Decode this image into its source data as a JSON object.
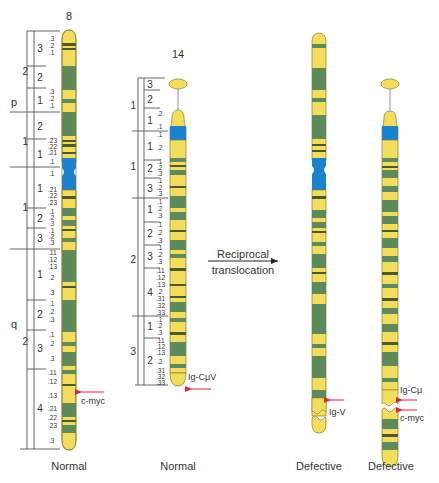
{
  "colors": {
    "light_band": "#f2de5c",
    "dark_band": "#5e8a5a",
    "thin_band": "#4a5a2a",
    "centromere": "#1a82cc",
    "outline": "#8a7a30",
    "arrow": "#d8283a",
    "text": "#333333"
  },
  "chromosomes": [
    {
      "id": "chr8-normal",
      "number": "8",
      "caption": "Normal",
      "arms": {
        "p": {
          "label": "p",
          "regions": [
            {
              "region": "2",
              "bands": [
                {
                  "band": "3",
                  "sub": [
                    ".3",
                    ".2",
                    ".1"
                  ]
                },
                {
                  "band": "2",
                  "sub": []
                },
                {
                  "band": "1",
                  "sub": [
                    ".3",
                    ".2",
                    ".1"
                  ]
                }
              ]
            },
            {
              "region": "1",
              "bands": [
                {
                  "band": "2",
                  "sub": []
                },
                {
                  "band": "1",
                  "sub": [
                    ".23",
                    ".22",
                    ".21",
                    ".1"
                  ]
                }
              ]
            }
          ]
        },
        "q": {
          "label": "q",
          "regions": [
            {
              "region": "1",
              "bands": [
                {
                  "band": "1",
                  "sub": [
                    ".1",
                    ".21",
                    ".22",
                    ".23"
                  ]
                },
                {
                  "band": "2",
                  "sub": [
                    ".1",
                    ".2",
                    ".3"
                  ]
                },
                {
                  "band": "3",
                  "sub": [
                    ".1",
                    ".2",
                    ".3"
                  ]
                }
              ]
            },
            {
              "region": "2",
              "bands": [
                {
                  "band": "1",
                  "sub": [
                    ".11",
                    ".12",
                    ".13",
                    ".2",
                    ".3"
                  ]
                },
                {
                  "band": "2",
                  "sub": [
                    ".1",
                    ".2",
                    ".3"
                  ]
                },
                {
                  "band": "3",
                  "sub": [
                    ".1",
                    ".2",
                    ".3"
                  ]
                },
                {
                  "band": "4",
                  "sub": [
                    ".11",
                    ".12",
                    ".13",
                    ".21",
                    ".22",
                    ".23",
                    ".3"
                  ]
                }
              ]
            }
          ]
        }
      },
      "gene_marks": [
        {
          "label": "c-myc"
        }
      ]
    },
    {
      "id": "chr14-normal",
      "number": "14",
      "caption": "Normal",
      "arms": {
        "p": {
          "regions": [
            {
              "region": "1",
              "bands": [
                {
                  "band": "3",
                  "sub": []
                },
                {
                  "band": "2",
                  "sub": []
                },
                {
                  "band": "1",
                  "sub": [
                    ".2",
                    ".1"
                  ]
                }
              ]
            }
          ]
        },
        "q": {
          "regions": [
            {
              "region": "1",
              "bands": [
                {
                  "band": "1",
                  "sub": [
                    ".1",
                    ".2"
                  ]
                },
                {
                  "band": "2",
                  "sub": [
                    ".1",
                    ".2",
                    ".3"
                  ]
                },
                {
                  "band": "3",
                  "sub": [
                    ".1",
                    ".2",
                    ".3"
                  ]
                }
              ]
            },
            {
              "region": "2",
              "bands": [
                {
                  "band": "1",
                  "sub": [
                    ".1",
                    ".2",
                    ".3"
                  ]
                },
                {
                  "band": "2",
                  "sub": [
                    ".1",
                    ".2",
                    ".3"
                  ]
                },
                {
                  "band": "3",
                  "sub": [
                    ".1",
                    ".2",
                    ".3"
                  ]
                },
                {
                  "band": "4",
                  "sub": [
                    ".11",
                    ".12",
                    ".13",
                    ".2",
                    ".31",
                    ".32",
                    ".33"
                  ]
                }
              ]
            },
            {
              "region": "3",
              "bands": [
                {
                  "band": "1",
                  "sub": [
                    ".1",
                    ".2",
                    ".3"
                  ]
                },
                {
                  "band": "2",
                  "sub": [
                    ".11",
                    ".12",
                    ".13",
                    ".2",
                    ".31",
                    ".32",
                    ".33"
                  ]
                }
              ]
            }
          ]
        }
      },
      "gene_marks": [
        {
          "label": "Ig-CμV"
        }
      ]
    },
    {
      "id": "chr8-defective",
      "caption": "Defective",
      "gene_marks": [
        {
          "label": "Ig-V"
        }
      ]
    },
    {
      "id": "chr14-defective",
      "caption": "Defective",
      "gene_marks": [
        {
          "label": "Ig-Cμ"
        },
        {
          "label": "c-myc"
        }
      ]
    }
  ],
  "process": {
    "label_line1": "Reciprocal",
    "label_line2": "translocation"
  }
}
